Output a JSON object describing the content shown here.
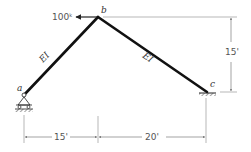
{
  "diagram": {
    "type": "structural-frame",
    "joints": {
      "a": {
        "label": "a",
        "support": "pin-roller"
      },
      "b": {
        "label": "b"
      },
      "c": {
        "label": "c",
        "support": "fixed"
      }
    },
    "members": [
      {
        "from": "a",
        "to": "b",
        "label": "EI"
      },
      {
        "from": "b",
        "to": "c",
        "label": "EI"
      }
    ],
    "load": {
      "at": "b",
      "value": "100",
      "unit": "k",
      "direction": "left"
    },
    "dimensions": {
      "horizontal_ab": "15'",
      "horizontal_bc": "20'",
      "vertical_bc": "15'"
    }
  }
}
